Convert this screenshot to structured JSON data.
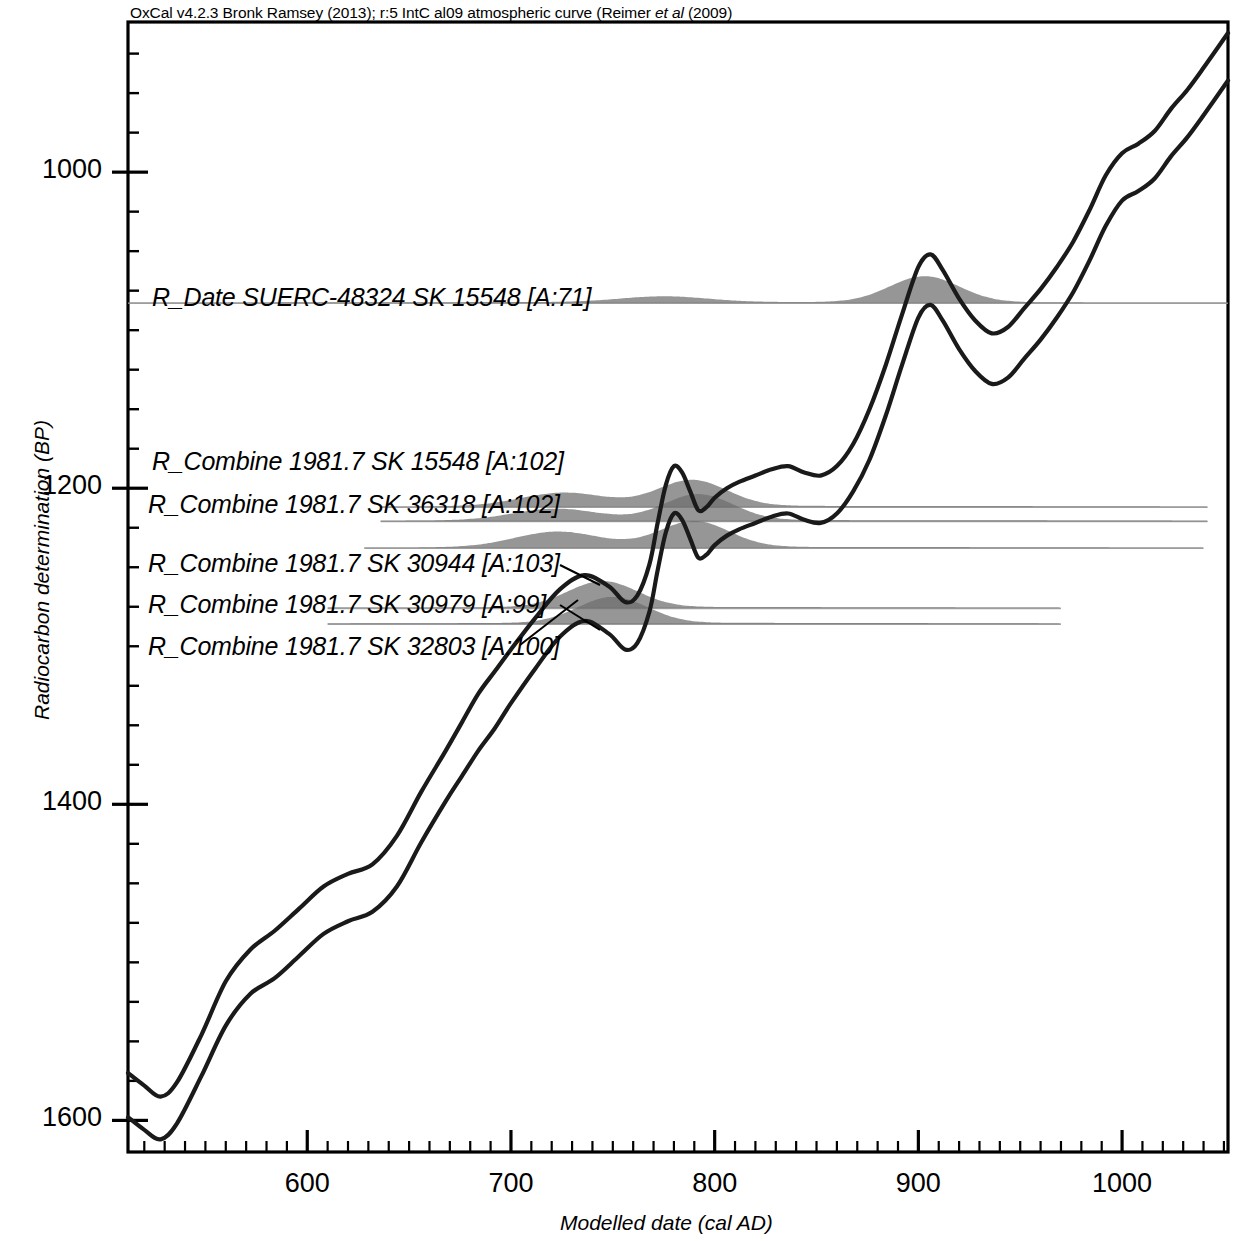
{
  "header": {
    "credit_part1": "OxCal v4.2.3 Bronk Ramsey (2013); r:5 IntC al09 atmospheric curve (Reimer ",
    "credit_italic": "et al",
    "credit_part2": " (2009)"
  },
  "axes": {
    "y_title": "Radiocarbon determination (BP)",
    "x_title": "Modelled date (cal AD)",
    "y_ticks": [
      "1000",
      "1200",
      "1400",
      "1600"
    ],
    "x_ticks": [
      "600",
      "700",
      "800",
      "900",
      "1000"
    ]
  },
  "samples": [
    {
      "label": "R_Date SUERC-48324  SK 15548 [A:71]"
    },
    {
      "label": "R_Combine 1981.7  SK 15548 [A:102]"
    },
    {
      "label": "R_Combine 1981.7 SK 36318 [A:102]"
    },
    {
      "label": "R_Combine 1981.7 SK 30944 [A:103]"
    },
    {
      "label": "R_Combine 1981.7 SK 30979 [A:99]"
    },
    {
      "label": "R_Combine 1981.7 SK 32803 [A:100]"
    }
  ],
  "colors": {
    "axis": "#000000",
    "curve": "#1a1a1a",
    "distribution_fill": "#6e6e6e",
    "baseline": "#9a9a9a",
    "background": "#ffffff"
  },
  "chart_data": {
    "type": "line",
    "xlabel": "Modelled date (cal AD)",
    "ylabel": "Radiocarbon determination (BP)",
    "xlim": [
      512,
      1052
    ],
    "ylim": [
      1620,
      905
    ],
    "y_inverted": true,
    "grid": false,
    "legend": "none",
    "x_major_ticks": [
      600,
      700,
      800,
      900,
      1000
    ],
    "x_minor_tick_step": 10,
    "y_major_ticks": [
      1000,
      1200,
      1400,
      1600
    ],
    "y_minor_tick_step": 25,
    "series": [
      {
        "name": "IntCal09 calibration curve (upper 1-sigma)",
        "x": [
          512,
          520,
          528,
          536,
          548,
          560,
          572,
          584,
          596,
          608,
          620,
          632,
          644,
          656,
          668,
          676,
          684,
          692,
          700,
          712,
          724,
          736,
          748,
          756,
          762,
          768,
          772,
          776,
          780,
          784,
          788,
          792,
          796,
          800,
          806,
          812,
          820,
          828,
          836,
          844,
          852,
          860,
          868,
          876,
          884,
          892,
          900,
          906,
          912,
          920,
          928,
          936,
          944,
          952,
          960,
          968,
          976,
          984,
          992,
          1000,
          1008,
          1016,
          1024,
          1032,
          1040,
          1052
        ],
        "y": [
          1570,
          1578,
          1585,
          1576,
          1546,
          1512,
          1492,
          1480,
          1466,
          1452,
          1444,
          1438,
          1420,
          1392,
          1366,
          1348,
          1330,
          1316,
          1302,
          1282,
          1264,
          1255,
          1262,
          1272,
          1268,
          1248,
          1222,
          1198,
          1186,
          1190,
          1202,
          1214,
          1212,
          1206,
          1200,
          1196,
          1192,
          1188,
          1186,
          1190,
          1192,
          1186,
          1172,
          1150,
          1122,
          1090,
          1060,
          1052,
          1062,
          1080,
          1094,
          1102,
          1098,
          1086,
          1074,
          1060,
          1044,
          1024,
          1002,
          988,
          982,
          974,
          960,
          948,
          934,
          912
        ]
      },
      {
        "name": "IntCal09 calibration curve (lower 1-sigma)",
        "x": [
          512,
          520,
          528,
          536,
          548,
          560,
          572,
          584,
          596,
          608,
          620,
          632,
          644,
          656,
          668,
          676,
          684,
          692,
          700,
          712,
          724,
          736,
          748,
          756,
          762,
          768,
          772,
          776,
          780,
          784,
          788,
          792,
          796,
          800,
          806,
          812,
          820,
          828,
          836,
          844,
          852,
          860,
          868,
          876,
          884,
          892,
          900,
          906,
          912,
          920,
          928,
          936,
          944,
          952,
          960,
          968,
          976,
          984,
          992,
          1000,
          1008,
          1016,
          1024,
          1032,
          1040,
          1052
        ],
        "y": [
          1598,
          1606,
          1612,
          1602,
          1572,
          1540,
          1520,
          1510,
          1496,
          1482,
          1474,
          1468,
          1452,
          1424,
          1398,
          1382,
          1366,
          1352,
          1336,
          1314,
          1294,
          1284,
          1292,
          1302,
          1298,
          1278,
          1252,
          1228,
          1216,
          1220,
          1232,
          1244,
          1242,
          1236,
          1230,
          1226,
          1222,
          1218,
          1216,
          1220,
          1222,
          1216,
          1202,
          1182,
          1154,
          1122,
          1092,
          1084,
          1094,
          1112,
          1126,
          1134,
          1130,
          1118,
          1106,
          1092,
          1076,
          1056,
          1034,
          1018,
          1012,
          1004,
          990,
          978,
          964,
          942
        ]
      }
    ],
    "posterior_distributions": [
      {
        "name": "R_Date SUERC-48324  SK 15548 [A:71]",
        "baseline_bp": 1083,
        "x_start": 512,
        "x_end": 1052,
        "modes": [
          {
            "center": 775,
            "height": 0.22
          },
          {
            "center": 903,
            "height": 1.0
          }
        ]
      },
      {
        "name": "R_Combine 1981.7  SK 15548 [A:102]",
        "baseline_bp": 1212,
        "x_start": 636,
        "x_end": 1042,
        "modes": [
          {
            "center": 726,
            "height": 0.52
          },
          {
            "center": 789,
            "height": 1.0
          }
        ]
      },
      {
        "name": "R_Combine 1981.7 SK 36318 [A:102]",
        "baseline_bp": 1221,
        "x_start": 636,
        "x_end": 1042,
        "modes": [
          {
            "center": 722,
            "height": 0.45
          },
          {
            "center": 792,
            "height": 1.0
          }
        ]
      },
      {
        "name": "R_Combine 1981.7 SK 30944 [A:103]",
        "baseline_bp": 1238,
        "x_start": 628,
        "x_end": 1040,
        "modes": [
          {
            "center": 723,
            "height": 0.6
          },
          {
            "center": 790,
            "height": 1.0
          }
        ]
      },
      {
        "name": "R_Combine 1981.7 SK 30979 [A:99]",
        "baseline_bp": 1276,
        "x_start": 610,
        "x_end": 970,
        "modes": [
          {
            "center": 745,
            "height": 1.0
          }
        ]
      },
      {
        "name": "R_Combine 1981.7 SK 32803 [A:100]",
        "baseline_bp": 1286,
        "x_start": 610,
        "x_end": 970,
        "modes": [
          {
            "center": 750,
            "height": 1.0
          }
        ]
      }
    ]
  }
}
